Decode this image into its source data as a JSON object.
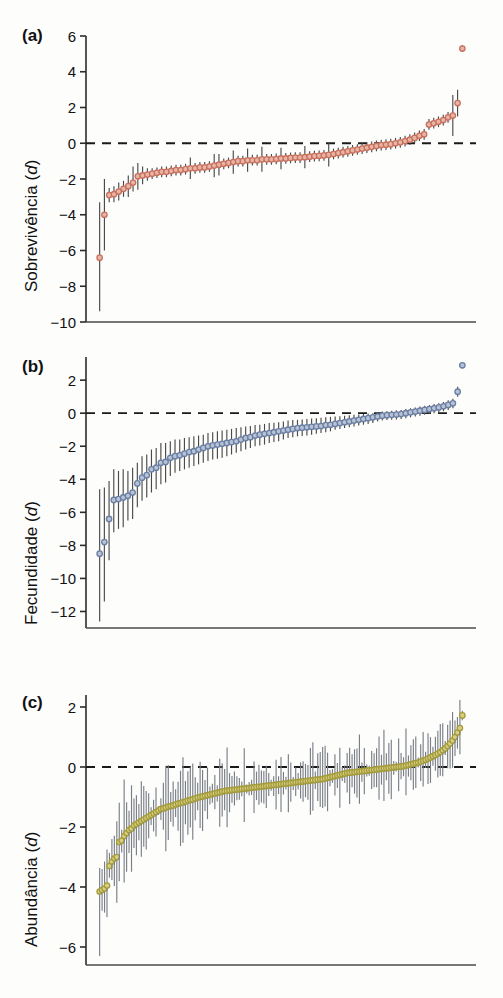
{
  "figure": {
    "background": "#fdfdfc",
    "panel_count": 3
  },
  "chart_data": [
    {
      "panel": "a",
      "label": "(a)",
      "type": "scatter",
      "title": "",
      "xlabel": "",
      "ylabel": "Sobrevivência (d)",
      "ylabel_main": "Sobrevivência (",
      "ylabel_italic": "d",
      "ylabel_close": ")",
      "marker_color": "#c8705e",
      "marker_fill": "#e8b4a4",
      "errorbar_color": "#4a4a4a",
      "zero_line": 0,
      "grid": false,
      "legend": "none",
      "ylim": [
        -10,
        6
      ],
      "yticks": [
        6,
        4,
        2,
        0,
        -2,
        -4,
        -6,
        -8,
        -10
      ],
      "ytick_labels": [
        "6",
        "4",
        "2",
        "0",
        "−2",
        "−4",
        "−6",
        "−8",
        "−10"
      ],
      "n_points": 72,
      "values": [
        -6.4,
        -4.0,
        -2.9,
        -2.85,
        -2.7,
        -2.55,
        -2.4,
        -2.2,
        -1.85,
        -1.8,
        -1.75,
        -1.7,
        -1.65,
        -1.6,
        -1.6,
        -1.55,
        -1.5,
        -1.5,
        -1.45,
        -1.4,
        -1.4,
        -1.35,
        -1.35,
        -1.3,
        -1.25,
        -1.2,
        -1.15,
        -1.1,
        -1.05,
        -1.0,
        -1.0,
        -0.95,
        -0.95,
        -0.95,
        -0.9,
        -0.9,
        -0.9,
        -0.88,
        -0.85,
        -0.85,
        -0.82,
        -0.8,
        -0.8,
        -0.78,
        -0.75,
        -0.72,
        -0.7,
        -0.68,
        -0.65,
        -0.6,
        -0.55,
        -0.5,
        -0.45,
        -0.4,
        -0.35,
        -0.3,
        -0.25,
        -0.2,
        -0.15,
        -0.1,
        -0.08,
        -0.05,
        0.0,
        0.05,
        0.12,
        0.2,
        0.3,
        0.42,
        0.5,
        1.05,
        1.12,
        1.2,
        1.3,
        1.45,
        1.55,
        2.25,
        5.3
      ],
      "err_low": [
        -9.4,
        -6.0,
        -3.3,
        -3.3,
        -3.2,
        -3.0,
        -3.0,
        -2.7,
        -2.6,
        -2.3,
        -2.1,
        -2.0,
        -1.95,
        -1.9,
        -1.9,
        -1.85,
        -1.8,
        -1.8,
        -1.75,
        -2.0,
        -1.7,
        -1.65,
        -1.65,
        -1.6,
        -1.9,
        -1.8,
        -1.45,
        -1.4,
        -1.7,
        -1.3,
        -1.3,
        -1.6,
        -1.25,
        -1.25,
        -1.6,
        -1.2,
        -1.2,
        -1.18,
        -1.45,
        -1.15,
        -1.12,
        -1.1,
        -1.1,
        -1.4,
        -1.05,
        -1.02,
        -1.0,
        -0.98,
        -1.3,
        -0.9,
        -0.85,
        -0.8,
        -0.75,
        -0.7,
        -0.65,
        -0.6,
        -0.55,
        -0.5,
        -0.45,
        -0.4,
        -0.38,
        -0.35,
        -0.3,
        -0.25,
        -0.18,
        -0.1,
        0.0,
        0.12,
        0.2,
        0.75,
        0.82,
        0.9,
        1.0,
        1.15,
        0.4,
        1.5,
        5.1
      ],
      "err_high": [
        -3.3,
        -2.0,
        -2.5,
        -2.4,
        -2.2,
        -2.1,
        -1.8,
        -1.3,
        -1.1,
        -1.3,
        -1.4,
        -1.4,
        -1.35,
        -1.3,
        -1.3,
        -1.25,
        -1.2,
        -1.2,
        -1.15,
        -0.8,
        -1.1,
        -1.05,
        -1.05,
        -1.0,
        -0.6,
        -0.6,
        -0.85,
        -0.8,
        -0.4,
        -0.7,
        -0.7,
        -0.3,
        -0.65,
        -0.65,
        -0.2,
        -0.6,
        -0.6,
        -0.58,
        -0.25,
        -0.55,
        -0.52,
        -0.5,
        -0.5,
        -0.15,
        -0.45,
        -0.42,
        -0.4,
        -0.38,
        -0.0,
        -0.3,
        -0.25,
        -0.2,
        -0.15,
        -0.1,
        -0.05,
        0.0,
        0.05,
        0.1,
        0.15,
        0.2,
        0.22,
        0.25,
        0.3,
        0.35,
        0.42,
        0.5,
        0.6,
        0.72,
        0.8,
        1.35,
        1.42,
        1.5,
        1.6,
        1.75,
        2.7,
        3.0,
        5.5
      ]
    },
    {
      "panel": "b",
      "label": "(b)",
      "type": "scatter",
      "title": "",
      "xlabel": "",
      "ylabel": "Fecundidade (d)",
      "ylabel_main": "Fecundidade (",
      "ylabel_italic": "d",
      "ylabel_close": ")",
      "marker_color": "#6b7fa3",
      "marker_fill": "#b6c2d6",
      "errorbar_color": "#4a4a4a",
      "zero_line": 0,
      "grid": false,
      "legend": "none",
      "ylim": [
        -13,
        3.4
      ],
      "yticks": [
        2,
        0,
        -2,
        -4,
        -6,
        -8,
        -10,
        -12
      ],
      "ytick_labels": [
        "2",
        "0",
        "−2",
        "−4",
        "−6",
        "−8",
        "−10",
        "−12"
      ],
      "n_points": 70,
      "values": [
        -8.5,
        -7.8,
        -6.4,
        -5.25,
        -5.2,
        -5.1,
        -5.0,
        -4.8,
        -4.25,
        -3.9,
        -3.75,
        -3.4,
        -3.3,
        -3.0,
        -2.95,
        -2.7,
        -2.6,
        -2.55,
        -2.45,
        -2.35,
        -2.3,
        -2.2,
        -2.1,
        -2.0,
        -1.95,
        -1.9,
        -1.85,
        -1.8,
        -1.75,
        -1.7,
        -1.6,
        -1.5,
        -1.45,
        -1.35,
        -1.3,
        -1.25,
        -1.2,
        -1.15,
        -1.1,
        -1.05,
        -1.0,
        -0.95,
        -0.9,
        -0.88,
        -0.85,
        -0.82,
        -0.8,
        -0.78,
        -0.72,
        -0.7,
        -0.65,
        -0.6,
        -0.55,
        -0.5,
        -0.45,
        -0.4,
        -0.35,
        -0.3,
        -0.25,
        -0.2,
        -0.15,
        -0.12,
        -0.1,
        -0.08,
        -0.05,
        0.0,
        0.05,
        0.1,
        0.15,
        0.2,
        0.25,
        0.3,
        0.35,
        0.42,
        0.5,
        0.6,
        1.3,
        2.9
      ],
      "err_low": [
        -12.6,
        -11.4,
        -8.9,
        -7.2,
        -7.0,
        -6.9,
        -6.5,
        -6.4,
        -5.7,
        -5.3,
        -5.1,
        -4.8,
        -4.6,
        -4.3,
        -4.2,
        -3.8,
        -3.6,
        -3.5,
        -3.4,
        -3.3,
        -3.2,
        -3.1,
        -3.0,
        -2.9,
        -2.8,
        -2.75,
        -2.7,
        -2.6,
        -2.5,
        -2.4,
        -2.3,
        -2.2,
        -2.1,
        -2.0,
        -1.95,
        -1.9,
        -1.8,
        -1.75,
        -1.7,
        -1.6,
        -1.5,
        -1.45,
        -1.4,
        -1.38,
        -1.35,
        -1.3,
        -1.25,
        -1.2,
        -1.15,
        -1.1,
        -1.0,
        -0.95,
        -0.9,
        -0.85,
        -0.8,
        -0.75,
        -0.7,
        -0.65,
        -0.6,
        -0.5,
        -0.45,
        -0.42,
        -0.4,
        -0.38,
        -0.35,
        -0.3,
        -0.25,
        -0.2,
        -0.15,
        -0.1,
        -0.05,
        0.0,
        0.05,
        0.12,
        0.2,
        0.3,
        1.0,
        2.7
      ],
      "err_high": [
        -4.6,
        -4.5,
        -4.1,
        -3.4,
        -3.5,
        -3.4,
        -3.5,
        -3.3,
        -3.0,
        -2.6,
        -2.5,
        -2.2,
        -2.1,
        -1.8,
        -1.8,
        -1.7,
        -1.6,
        -1.6,
        -1.5,
        -1.45,
        -1.4,
        -1.35,
        -1.3,
        -1.2,
        -1.15,
        -1.1,
        -1.05,
        -1.0,
        -0.95,
        -0.9,
        -0.85,
        -0.8,
        -0.78,
        -0.72,
        -0.7,
        -0.65,
        -0.6,
        -0.58,
        -0.55,
        -0.5,
        -0.45,
        -0.42,
        -0.4,
        -0.38,
        -0.35,
        -0.32,
        -0.3,
        -0.28,
        -0.25,
        -0.22,
        -0.2,
        -0.18,
        -0.15,
        -0.12,
        -0.1,
        -0.08,
        -0.05,
        -0.02,
        0.0,
        0.05,
        0.1,
        0.12,
        0.15,
        0.18,
        0.2,
        0.25,
        0.3,
        0.35,
        0.4,
        0.45,
        0.5,
        0.55,
        0.6,
        0.68,
        0.78,
        0.88,
        1.6,
        3.1
      ]
    },
    {
      "panel": "c",
      "label": "(c)",
      "type": "scatter",
      "title": "",
      "xlabel": "",
      "ylabel": "Abundância (d)",
      "ylabel_main": "Abundância (",
      "ylabel_italic": "d",
      "ylabel_close": ")",
      "marker_color": "#a39b3c",
      "marker_fill": "#d8d080",
      "errorbar_color": "#7a7f86",
      "zero_line": 0,
      "grid": false,
      "legend": "none",
      "ylim": [
        -6.6,
        2.4
      ],
      "yticks": [
        2,
        0,
        -2,
        -4,
        -6
      ],
      "ytick_labels": [
        "2",
        "0",
        "−2",
        "−4",
        "−6"
      ],
      "n_points": 150,
      "values": [
        -4.15,
        -4.1,
        -4.05,
        -3.95,
        -3.3,
        -3.15,
        -3.05,
        -3.0,
        -2.5,
        -2.45,
        -2.3,
        -2.2,
        -2.1,
        -2.05,
        -1.95,
        -1.9,
        -1.85,
        -1.8,
        -1.75,
        -1.7,
        -1.65,
        -1.6,
        -1.55,
        -1.5,
        -1.45,
        -1.4,
        -1.38,
        -1.35,
        -1.32,
        -1.3,
        -1.28,
        -1.25,
        -1.22,
        -1.2,
        -1.18,
        -1.15,
        -1.12,
        -1.1,
        -1.08,
        -1.05,
        -1.02,
        -1.0,
        -0.98,
        -0.96,
        -0.94,
        -0.92,
        -0.9,
        -0.88,
        -0.86,
        -0.84,
        -0.82,
        -0.8,
        -0.79,
        -0.78,
        -0.77,
        -0.76,
        -0.75,
        -0.74,
        -0.73,
        -0.72,
        -0.71,
        -0.7,
        -0.69,
        -0.68,
        -0.67,
        -0.66,
        -0.65,
        -0.64,
        -0.63,
        -0.62,
        -0.61,
        -0.6,
        -0.59,
        -0.58,
        -0.57,
        -0.56,
        -0.55,
        -0.54,
        -0.53,
        -0.52,
        -0.51,
        -0.5,
        -0.49,
        -0.48,
        -0.47,
        -0.46,
        -0.45,
        -0.44,
        -0.43,
        -0.42,
        -0.41,
        -0.4,
        -0.38,
        -0.36,
        -0.34,
        -0.32,
        -0.3,
        -0.28,
        -0.26,
        -0.24,
        -0.22,
        -0.2,
        -0.19,
        -0.18,
        -0.17,
        -0.16,
        -0.15,
        -0.14,
        -0.13,
        -0.12,
        -0.11,
        -0.1,
        -0.09,
        -0.08,
        -0.07,
        -0.06,
        -0.05,
        -0.04,
        -0.03,
        -0.02,
        -0.01,
        0.0,
        0.01,
        0.02,
        0.03,
        0.05,
        0.07,
        0.09,
        0.11,
        0.13,
        0.15,
        0.18,
        0.21,
        0.24,
        0.28,
        0.32,
        0.36,
        0.4,
        0.45,
        0.5,
        0.56,
        0.62,
        0.7,
        0.78,
        0.88,
        1.0,
        1.15,
        1.3,
        1.72
      ],
      "err_spread_min": 0.15,
      "err_spread_max": 1.6,
      "err_outlier_index": 0,
      "err_outlier_low": -6.3
    }
  ]
}
